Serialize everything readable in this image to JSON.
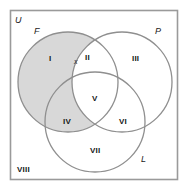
{
  "figure": {
    "type": "venn-diagram-3-set",
    "universe_label": "U",
    "background_color": "#ffffff",
    "box_border_color": "#9a9a9a",
    "circle_stroke_color": "#8f8f8f",
    "shade_color": "#d6d6d6",
    "text_color": "#1b1b1b"
  },
  "sets": {
    "f": {
      "label": "F",
      "shaded": true
    },
    "p": {
      "label": "P",
      "shaded": false
    },
    "l": {
      "label": "L",
      "shaded": false
    }
  },
  "regions": [
    {
      "id": "I",
      "label": "I",
      "membership": "F only",
      "shaded": true
    },
    {
      "id": "II",
      "label": "II",
      "membership": "F and P",
      "shaded": false
    },
    {
      "id": "III",
      "label": "III",
      "membership": "P only",
      "shaded": false
    },
    {
      "id": "IV",
      "label": "IV",
      "membership": "F and L",
      "shaded": true
    },
    {
      "id": "V",
      "label": "V",
      "membership": "F and P and L",
      "shaded": false
    },
    {
      "id": "VI",
      "label": "VI",
      "membership": "P and L",
      "shaded": false
    },
    {
      "id": "VII",
      "label": "VII",
      "membership": "L only",
      "shaded": false
    },
    {
      "id": "VIII",
      "label": "VIII",
      "membership": "outside all",
      "shaded": false
    }
  ],
  "markers": [
    {
      "id": "x",
      "label": "x",
      "in_region": "II"
    }
  ]
}
